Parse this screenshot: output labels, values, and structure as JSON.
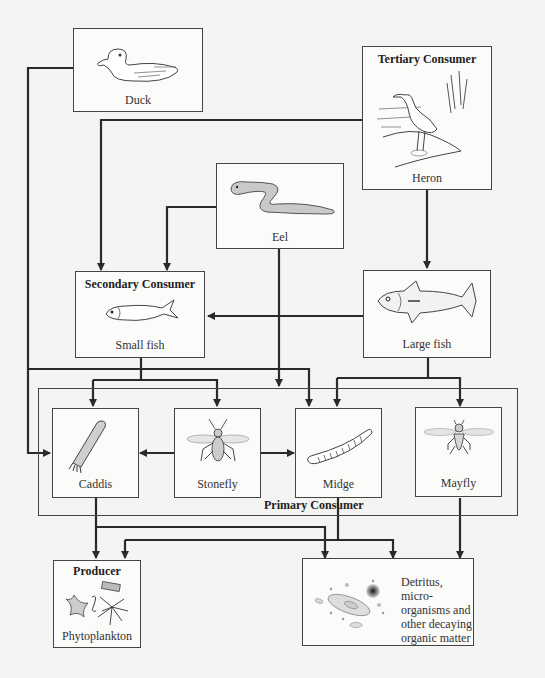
{
  "diagram": {
    "type": "food-web",
    "colors": {
      "line": "#2a2a2a",
      "box_border": "#444444",
      "background": "#f4f4f2",
      "box_fill": "#fbfbfa"
    },
    "nodes": {
      "duck": {
        "label": "Duck",
        "icon": "duck-icon"
      },
      "heron": {
        "title": "Tertiary Consumer",
        "label": "Heron",
        "icon": "heron-icon"
      },
      "eel": {
        "label": "Eel",
        "icon": "eel-icon"
      },
      "small_fish": {
        "title": "Secondary Consumer",
        "label": "Small fish",
        "icon": "small-fish-icon"
      },
      "large_fish": {
        "label": "Large fish",
        "icon": "large-fish-icon"
      },
      "caddis": {
        "label": "Caddis",
        "icon": "caddis-icon"
      },
      "stonefly": {
        "label": "Stonefly",
        "icon": "stonefly-icon"
      },
      "midge": {
        "label": "Midge",
        "icon": "midge-icon"
      },
      "mayfly": {
        "label": "Mayfly",
        "icon": "mayfly-icon"
      },
      "phytoplankton": {
        "title": "Producer",
        "label": "Phytoplankton",
        "icon": "phytoplankton-icon"
      },
      "detritus": {
        "lines": [
          "Detritus, micro-",
          "organisms and",
          "other decaying",
          "organic matter"
        ],
        "icon": "detritus-icon"
      }
    },
    "groups": {
      "primary_consumer": {
        "title": "Primary Consumer",
        "members": [
          "Caddis",
          "Stonefly",
          "Midge",
          "Mayfly"
        ]
      }
    },
    "edges": [
      {
        "from": "Heron",
        "to": "Small fish"
      },
      {
        "from": "Heron",
        "to": "Large fish"
      },
      {
        "from": "Duck",
        "to": "Caddis"
      },
      {
        "from": "Eel",
        "to": "Small fish"
      },
      {
        "from": "Eel",
        "to": "Primary Consumer"
      },
      {
        "from": "Large fish",
        "to": "Small fish"
      },
      {
        "from": "Small fish",
        "to": "Caddis"
      },
      {
        "from": "Small fish",
        "to": "Stonefly"
      },
      {
        "from": "Small fish",
        "to": "Midge"
      },
      {
        "from": "Large fish",
        "to": "Midge"
      },
      {
        "from": "Large fish",
        "to": "Mayfly"
      },
      {
        "from": "Stonefly",
        "to": "Caddis"
      },
      {
        "from": "Stonefly",
        "to": "Midge"
      },
      {
        "from": "Caddis",
        "to": "Phytoplankton"
      },
      {
        "from": "Caddis",
        "to": "Detritus"
      },
      {
        "from": "Midge",
        "to": "Phytoplankton"
      },
      {
        "from": "Midge",
        "to": "Detritus"
      },
      {
        "from": "Mayfly",
        "to": "Detritus"
      }
    ]
  }
}
